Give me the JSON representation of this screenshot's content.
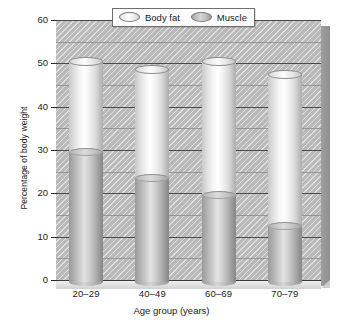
{
  "chart_data": {
    "type": "bar",
    "subtype": "stacked-cylinder",
    "title": "",
    "xlabel": "Age group (years)",
    "ylabel": "Percentage of body weight",
    "categories": [
      "20–29",
      "40–49",
      "60–69",
      "70–79"
    ],
    "series": [
      {
        "name": "Muscle",
        "values": [
          30,
          24,
          20,
          13
        ],
        "color": "#b0b0b0"
      },
      {
        "name": "Body fat",
        "values": [
          21,
          25,
          31,
          35
        ],
        "color": "#ededed"
      }
    ],
    "totals": [
      51,
      49,
      51,
      48
    ],
    "ylim": [
      0,
      60
    ],
    "yticks": [
      0,
      10,
      20,
      30,
      40,
      50,
      60
    ],
    "ytick_labels": [
      "0",
      "10",
      "20",
      "30",
      "40",
      "50",
      "60"
    ],
    "minor_tick_step": 5,
    "grid": true,
    "legend_position": "top-right",
    "stack_order_bottom_to_top": [
      "Muscle",
      "Body fat"
    ]
  },
  "legend": {
    "items": [
      {
        "label": "Body fat",
        "swatch": "cylinder-light-icon"
      },
      {
        "label": "Muscle",
        "swatch": "cylinder-dark-icon"
      }
    ]
  },
  "axes": {
    "y_title": "Percentage of body weight",
    "x_title": "Age group (years)"
  }
}
